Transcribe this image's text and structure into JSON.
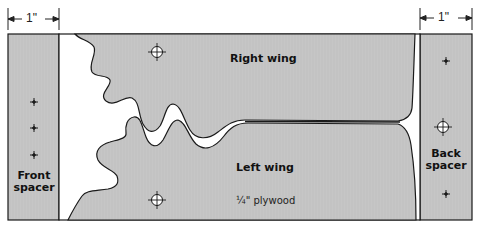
{
  "diagram": {
    "type": "woodworking-template",
    "dimensions": {
      "front_spacer_width": "1\"",
      "back_spacer_width": "1\""
    },
    "labels": {
      "right_wing": "Right wing",
      "left_wing": "Left wing",
      "material": "¼\" plywood",
      "front_spacer_line1": "Front",
      "front_spacer_line2": "spacer",
      "back_spacer_line1": "Back",
      "back_spacer_line2": "spacer"
    },
    "colors": {
      "fill": "#c4c4c4",
      "stroke": "#1a1a1a",
      "cut": "#ffffff"
    },
    "holes": {
      "large": [
        {
          "x": 157,
          "y": 52,
          "part": "right-wing"
        },
        {
          "x": 157,
          "y": 200,
          "part": "left-wing"
        },
        {
          "x": 443,
          "y": 127,
          "part": "back-spacer"
        }
      ],
      "small": [
        {
          "x": 34,
          "y": 102,
          "part": "front-spacer"
        },
        {
          "x": 34,
          "y": 128,
          "part": "front-spacer"
        },
        {
          "x": 34,
          "y": 155,
          "part": "front-spacer"
        },
        {
          "x": 443,
          "y": 62,
          "part": "back-spacer"
        },
        {
          "x": 443,
          "y": 193,
          "part": "back-spacer"
        }
      ]
    }
  }
}
